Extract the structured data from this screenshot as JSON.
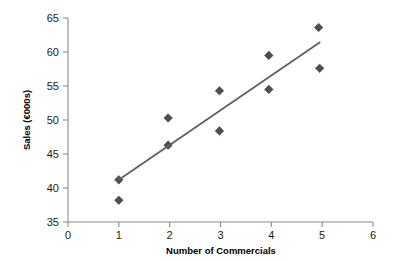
{
  "chart_data": {
    "type": "scatter",
    "title": "",
    "xlabel": "Number of Commercials",
    "ylabel": "Sales (€000s)",
    "xlim": [
      0,
      6
    ],
    "ylim": [
      35,
      65
    ],
    "xticks": [
      "0",
      "1",
      "2",
      "3",
      "4",
      "5",
      "6"
    ],
    "yticks": [
      "35",
      "40",
      "45",
      "50",
      "55",
      "60",
      "65"
    ],
    "grid": false,
    "legend": null,
    "marker_shape": "diamond",
    "marker_color": "#4d4d55",
    "trendline_color": "#5f5f66",
    "axis_color": "#8a8a8a",
    "points": [
      {
        "x": 1.0,
        "y": 41.2
      },
      {
        "x": 1.0,
        "y": 38.2
      },
      {
        "x": 1.97,
        "y": 50.3
      },
      {
        "x": 1.97,
        "y": 46.3
      },
      {
        "x": 2.98,
        "y": 54.3
      },
      {
        "x": 2.98,
        "y": 48.4
      },
      {
        "x": 3.95,
        "y": 59.5
      },
      {
        "x": 3.95,
        "y": 54.5
      },
      {
        "x": 4.93,
        "y": 63.6
      },
      {
        "x": 4.95,
        "y": 57.6
      }
    ],
    "trendline": {
      "x_start": 1.0,
      "y_start": 41.2,
      "x_end": 4.95,
      "y_end": 61.4
    }
  },
  "axis_titles": {
    "x": "Number of Commercials",
    "y": "Sales (€000s)"
  },
  "ticks": {
    "x": [
      "0",
      "1",
      "2",
      "3",
      "4",
      "5",
      "6"
    ],
    "y": [
      "35",
      "40",
      "45",
      "50",
      "55",
      "60",
      "65"
    ]
  }
}
